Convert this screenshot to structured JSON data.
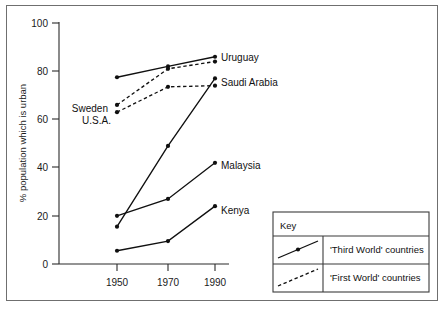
{
  "chart_data": {
    "type": "line",
    "title": "",
    "subtitle": "",
    "xlabel": "",
    "ylabel": "% population which is urban",
    "x": [
      1950,
      1970,
      1990
    ],
    "categories": [
      "1950",
      "1970",
      "1990"
    ],
    "xtick_labels": [
      "1950",
      "1970",
      "1990"
    ],
    "ytick_labels": [
      "0",
      "20",
      "40",
      "60",
      "80",
      "100"
    ],
    "ytick_values": [
      0,
      20,
      40,
      60,
      80,
      100
    ],
    "ylim": [
      0,
      100
    ],
    "xlim": [
      1940,
      2000
    ],
    "grid": false,
    "legend_position": "bottom-right",
    "series": [
      {
        "name": "Uruguay",
        "group": "Third World",
        "style": "solid",
        "values": [
          77.5,
          82.0,
          86.0
        ]
      },
      {
        "name": "Sweden",
        "group": "First World",
        "style": "dashed",
        "values": [
          66.0,
          81.0,
          84.0
        ]
      },
      {
        "name": "U.S.A.",
        "group": "First World",
        "style": "dashed",
        "values": [
          63.0,
          73.5,
          74.0
        ]
      },
      {
        "name": "Saudi Arabia",
        "group": "Third World",
        "style": "solid",
        "values": [
          15.5,
          49.0,
          77.0
        ]
      },
      {
        "name": "Malaysia",
        "group": "Third World",
        "style": "solid",
        "values": [
          20.0,
          27.0,
          42.0
        ]
      },
      {
        "name": "Kenya",
        "group": "Third World",
        "style": "solid",
        "values": [
          5.5,
          9.5,
          24.0
        ]
      }
    ],
    "annotations": [
      {
        "name": "Uruguay",
        "anchor": "right"
      },
      {
        "name": "Saudi Arabia",
        "anchor": "right"
      },
      {
        "name": "Malaysia",
        "anchor": "right"
      },
      {
        "name": "Kenya",
        "anchor": "right"
      },
      {
        "name": "Sweden",
        "anchor": "left"
      },
      {
        "name": "U.S.A.",
        "anchor": "left"
      }
    ]
  },
  "axes": {
    "y_axis_label": "% population which is urban",
    "y_ticks": [
      "100",
      "80",
      "60",
      "40",
      "20",
      "0"
    ],
    "x_ticks": [
      "1950",
      "1970",
      "1990"
    ]
  },
  "series_labels": {
    "uruguay": "Uruguay",
    "saudi_arabia": "Saudi Arabia",
    "malaysia": "Malaysia",
    "kenya": "Kenya",
    "sweden": "Sweden",
    "usa": "U.S.A."
  },
  "key": {
    "title": "Key",
    "entries": [
      {
        "label": "'Third World'  countries",
        "style": "solid"
      },
      {
        "label": "'First World'  countries",
        "style": "dashed"
      }
    ]
  },
  "colors": {
    "ink": "#101010",
    "axis": "#2b2b2b",
    "frame": "#6f6f6f",
    "background": "#ffffff"
  }
}
